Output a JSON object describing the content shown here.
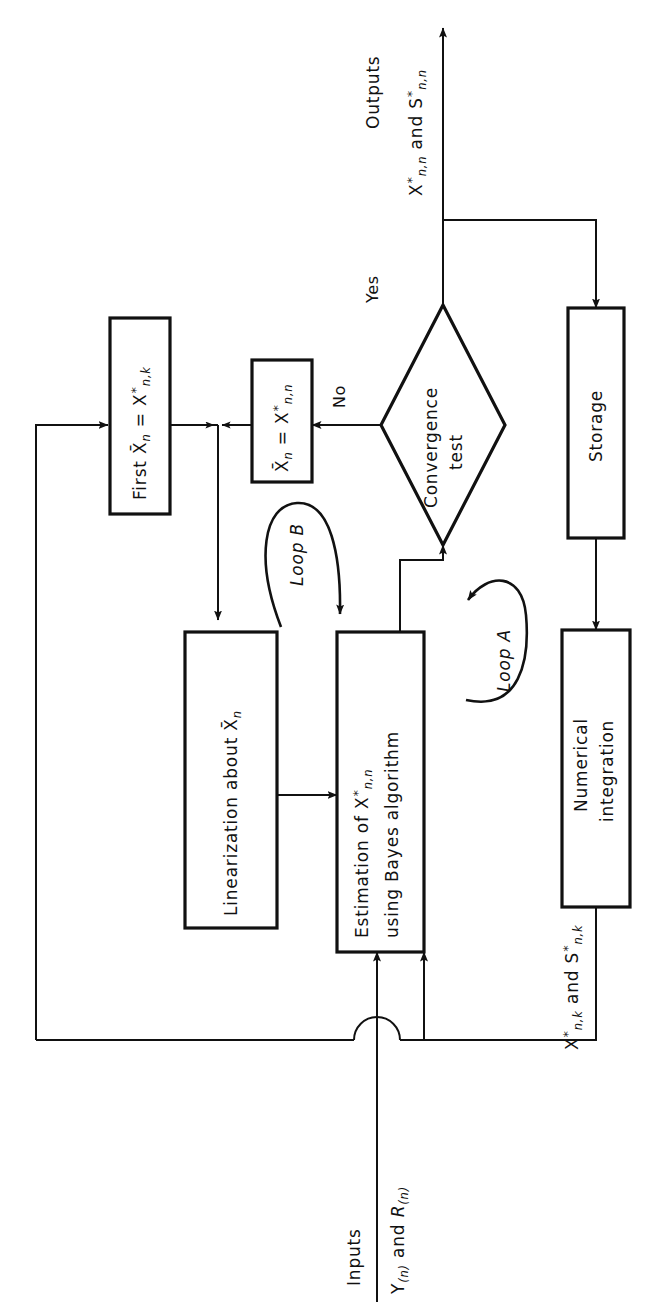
{
  "figure": {
    "type": "flowchart",
    "orientation": "rotated-90",
    "background_color": "#ffffff",
    "line_color": "#111111"
  },
  "nodes": {
    "first_estimate": {
      "shape": "rectangle",
      "label": "First X̄ₙ = X*ₙ,ₖ",
      "text_main": "First X",
      "text_bar_var": "n",
      "text_eq": "= X",
      "text_sub2": "n,k"
    },
    "update_estimate": {
      "shape": "rectangle",
      "label": "X̄ₙ = X*ₙ,ₙ"
    },
    "convergence": {
      "shape": "diamond",
      "label_line1": "Convergence",
      "label_line2": "test"
    },
    "storage": {
      "shape": "rectangle",
      "label": "Storage"
    },
    "numerical_integration": {
      "shape": "rectangle",
      "label_line1": "Numerical",
      "label_line2": "integration"
    },
    "linearization": {
      "shape": "rectangle",
      "label": "Linearization about X̄ₙ"
    },
    "estimation": {
      "shape": "rectangle",
      "label_line1": "Estimation of X*ₙ,ₙ",
      "label_line2": "using Bayes algorithm"
    }
  },
  "edge_labels": {
    "yes": "Yes",
    "no": "No",
    "loop_a": "Loop A",
    "loop_b": "Loop B"
  },
  "io_labels": {
    "outputs_title": "Outputs",
    "outputs_vars": "X*ₙ,ₙ and S*ₙ,ₙ",
    "inputs_title": "Inputs",
    "inputs_vars": "Y₍ₙ₎ and R₍ₙ₎",
    "feedback_vars": "X*ₙ,ₖ and S*ₙ,ₖ"
  },
  "text_parts": {
    "X": "X",
    "S": "S",
    "Y": "Y",
    "R": "R",
    "star": "*",
    "eq": "=",
    "and": "and",
    "first": "First",
    "sub_nn": "n,n",
    "sub_nk": "n,k",
    "sub_n": "n",
    "paren_n": "(n)",
    "storage": "Storage",
    "numerical": "Numerical",
    "integration": "integration",
    "convergence": "Convergence",
    "test": "test",
    "linearization_about": "Linearization about",
    "estimation_of": "Estimation of",
    "using_bayes": "using Bayes algorithm",
    "outputs": "Outputs",
    "inputs": "Inputs",
    "yes": "Yes",
    "no": "No",
    "loop": "Loop",
    "A": "A",
    "B": "B"
  }
}
